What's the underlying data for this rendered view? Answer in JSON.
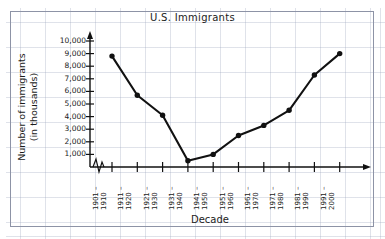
{
  "figure": {
    "title": "U.S. Immigrants",
    "x_axis_title": "Decade",
    "y_axis_title_line1": "Number of immigrants",
    "y_axis_title_line2": "(in thousands)",
    "axis_break_symbol": "zigzag-break"
  },
  "chart_data": {
    "type": "line",
    "title": "U.S. Immigrants",
    "xlabel": "Decade",
    "ylabel": "Number of immigrants (in thousands)",
    "categories": [
      "1901 –\n1910",
      "1911 –\n1920",
      "1921 –\n1930",
      "1931 –\n1940",
      "1941 –\n1950",
      "1951 –\n1960",
      "1961 –\n1970",
      "1971 –\n1980",
      "1981 –\n1990",
      "1991 –\n2000"
    ],
    "categories_line1": [
      "1901 –",
      "1911 –",
      "1921 –",
      "1931 –",
      "1941 –",
      "1951 –",
      "1961 –",
      "1971 –",
      "1981 –",
      "1991 –"
    ],
    "categories_line2": [
      "1910",
      "1920",
      "1930",
      "1940",
      "1950",
      "1960",
      "1970",
      "1980",
      "1990",
      "2000"
    ],
    "values": [
      8800,
      5700,
      4100,
      500,
      1000,
      2500,
      3300,
      4500,
      7300,
      9000
    ],
    "ylim": [
      0,
      10000
    ],
    "ytick_labels": [
      "1,000",
      "2,000",
      "3,000",
      "4,000",
      "5,000",
      "6,000",
      "7,000",
      "8,000",
      "9,000",
      "10,000"
    ],
    "ytick_values": [
      1000,
      2000,
      3000,
      4000,
      5000,
      6000,
      7000,
      8000,
      9000,
      10000
    ],
    "grid": true,
    "legend": null,
    "marker": "filled-circle",
    "line_color": "#111111",
    "grid_color": "#9aa0b4"
  }
}
